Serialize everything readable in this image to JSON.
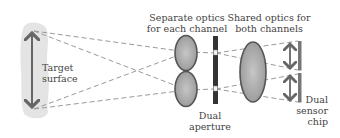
{
  "labels": {
    "target": {
      "line1": "Target",
      "line2": "surface"
    },
    "separate_optics": {
      "line1": "Separate optics",
      "line2": "for each channel"
    },
    "shared_optics": {
      "line1": "Shared optics for",
      "line2": "both channels"
    },
    "dual_aperture": {
      "line1": "Dual",
      "line2": "aperture"
    },
    "sensor_chip": {
      "line1": "Dual",
      "line2": "sensor",
      "line3": "chip"
    }
  },
  "colors": {
    "target_fill": "#e4e4e4",
    "arrow": "#666666",
    "lens_fill": "#a8a8a8",
    "lens_stroke": "#555555",
    "aperture_bar": "#333333",
    "sensor": "#777777",
    "ray": "#999999",
    "text": "#444444"
  }
}
